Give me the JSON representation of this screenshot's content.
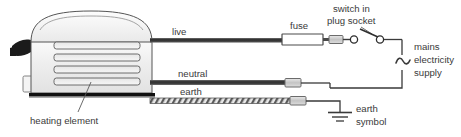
{
  "diagram": {
    "appliance": {
      "name": "toaster",
      "element_label": "heating element",
      "slot_count": 4
    },
    "labels": {
      "live": "live",
      "neutral": "neutral",
      "earth": "earth",
      "fuse": "fuse",
      "switch_line1": "switch in",
      "switch_line2": "plug socket",
      "mains_line1": "mains",
      "mains_line2": "electricity",
      "mains_line3": "supply",
      "earth_symbol_line1": "earth",
      "earth_symbol_line2": "symbol",
      "heating_element": "heating element",
      "ac_symbol": "~"
    },
    "colors": {
      "wire_dark": "#4a4a4a",
      "wire_core": "#2b2b2b",
      "connector_fill": "#cfcfcf",
      "connector_stroke": "#6b6b6b",
      "body_fill": "#f2f2f2",
      "body_stroke": "#555555",
      "text": "#3a3a3a",
      "base_dark": "#111111",
      "lever_dark": "#1a1a1a",
      "earth_stripe": "#bdbdbd"
    }
  }
}
